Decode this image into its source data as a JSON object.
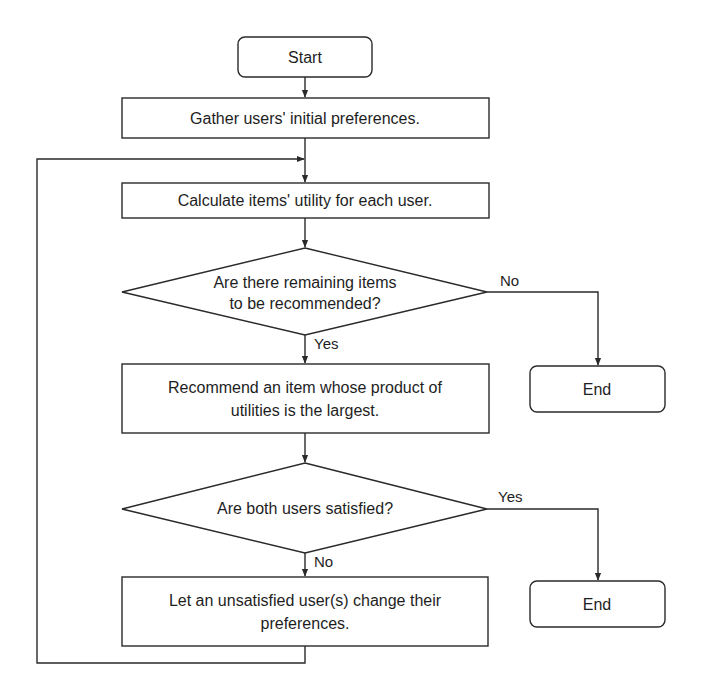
{
  "diagram": {
    "type": "flowchart",
    "nodes": {
      "start": {
        "label": "Start",
        "shape": "rounded-rect"
      },
      "gather": {
        "label": "Gather users' initial preferences.",
        "shape": "rect"
      },
      "calculate": {
        "label": "Calculate items' utility for each user.",
        "shape": "rect"
      },
      "remaining": {
        "line1": "Are there remaining items",
        "line2": "to be recommended?",
        "shape": "diamond"
      },
      "recommend": {
        "line1": "Recommend an item whose product of",
        "line2": "utilities is the largest.",
        "shape": "rect"
      },
      "satisfied": {
        "label": "Are both users satisfied?",
        "shape": "diamond"
      },
      "change": {
        "line1": "Let an unsatisfied user(s) change their",
        "line2": "preferences.",
        "shape": "rect"
      },
      "end1": {
        "label": "End",
        "shape": "rounded-rect"
      },
      "end2": {
        "label": "End",
        "shape": "rounded-rect"
      }
    },
    "edges": {
      "remaining_no": "No",
      "remaining_yes": "Yes",
      "satisfied_yes": "Yes",
      "satisfied_no": "No"
    },
    "colors": {
      "stroke": "#2a2a2a",
      "text": "#1e1e1e",
      "background": "#ffffff"
    }
  }
}
